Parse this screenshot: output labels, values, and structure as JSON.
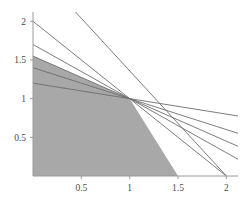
{
  "chart_data": {
    "type": "line",
    "title": "",
    "subtitle": "",
    "xlabel": "",
    "ylabel": "",
    "xlim": [
      0,
      2.12
    ],
    "ylim": [
      0,
      2.12
    ],
    "grid": false,
    "legend": null,
    "background": "#ffffff",
    "axis_color": "#9a9a9a",
    "line_color": "#6e6e6e",
    "region_fill": "#a8a8a8",
    "region_fill_dark": "#9a9a9a",
    "xticks": [
      0.5,
      1,
      1.5,
      2
    ],
    "xtick_labels": [
      "0.5",
      "1",
      "1.5",
      "2"
    ],
    "yticks": [
      0.5,
      1,
      1.5,
      2
    ],
    "ytick_labels": [
      "0.5",
      "1",
      "1.5",
      "2"
    ],
    "common_point": [
      1,
      1
    ],
    "annotation": "All constraint lines intersect at the degenerate vertex (1, 1)",
    "series": [
      {
        "name": "line-1",
        "intercept": 2.0,
        "slope": -1.0,
        "x": [
          0,
          2.12
        ],
        "y": [
          2.0,
          -0.12
        ]
      },
      {
        "name": "line-2",
        "intercept": 1.7,
        "slope": -0.7,
        "x": [
          0,
          2.12
        ],
        "y": [
          1.7,
          0.216
        ]
      },
      {
        "name": "line-3",
        "intercept": 1.55,
        "slope": -0.55,
        "x": [
          0,
          2.12
        ],
        "y": [
          1.55,
          0.384
        ]
      },
      {
        "name": "line-4",
        "intercept": 1.4,
        "slope": -0.4,
        "x": [
          0,
          2.12
        ],
        "y": [
          1.4,
          0.552
        ]
      },
      {
        "name": "line-5",
        "intercept": 1.2,
        "slope": -0.2,
        "x": [
          0,
          2.12
        ],
        "y": [
          1.2,
          0.776
        ]
      },
      {
        "name": "line-6",
        "intercept": 3.0,
        "slope": -2.0,
        "x": [
          0.44,
          2.0
        ],
        "y": [
          2.12,
          0.0
        ]
      }
    ],
    "feasible_region": {
      "name": "feasible-region",
      "vertices": [
        [
          0,
          0
        ],
        [
          0,
          1.55
        ],
        [
          1,
          1
        ],
        [
          1.5,
          0
        ]
      ],
      "fill": "#a8a8a8"
    }
  }
}
